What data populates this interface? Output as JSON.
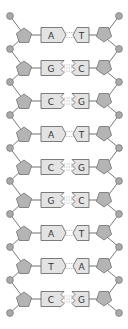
{
  "diagram": {
    "type": "dna-double-helix-ladder",
    "colors": {
      "background": "#ffffff",
      "phosphate": "#a9a9a9",
      "sugar": "#b4b4b4",
      "base": "#e3e3e3",
      "outline": "#6e6e6e",
      "text": "#333333"
    },
    "base_pairs": [
      {
        "left": "A",
        "right": "T",
        "bonds": 2
      },
      {
        "left": "G",
        "right": "C",
        "bonds": 3
      },
      {
        "left": "C",
        "right": "G",
        "bonds": 3
      },
      {
        "left": "A",
        "right": "T",
        "bonds": 2
      },
      {
        "left": "C",
        "right": "G",
        "bonds": 3
      },
      {
        "left": "G",
        "right": "C",
        "bonds": 3
      },
      {
        "left": "A",
        "right": "T",
        "bonds": 2
      },
      {
        "left": "T",
        "right": "A",
        "bonds": 2
      },
      {
        "left": "C",
        "right": "G",
        "bonds": 3
      }
    ]
  }
}
